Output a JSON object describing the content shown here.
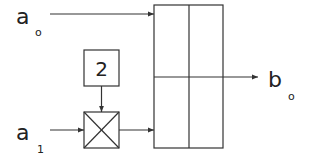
{
  "diagram": {
    "inputs": [
      {
        "id": "a0",
        "label": "a",
        "subscript": "o"
      },
      {
        "id": "a1",
        "label": "a",
        "subscript": "1"
      }
    ],
    "constant_box": {
      "label": "2"
    },
    "multiplier": {
      "symbol": "cross"
    },
    "output": {
      "id": "b0",
      "label": "b",
      "subscript": "o"
    },
    "block": {
      "rows": 2,
      "cols": 2
    },
    "colors": {
      "stroke": "#333333",
      "text": "#222222",
      "background": "#ffffff"
    }
  }
}
